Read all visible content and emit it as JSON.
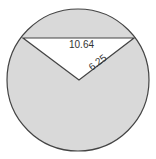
{
  "diagram": {
    "type": "circle-sector-segment",
    "colors": {
      "background": "#ffffff",
      "shaded_fill": "#d9d9d9",
      "unshaded_fill": "#ffffff",
      "stroke": "#444444",
      "text": "#333333"
    },
    "circle": {
      "cx": 78,
      "cy": 80,
      "r": 71
    },
    "triangle": {
      "vertices": [
        [
          23,
          38
        ],
        [
          134,
          38
        ],
        [
          79,
          80
        ]
      ]
    },
    "labels": {
      "chord_length": "10.64",
      "radius_length": "6.25"
    }
  }
}
